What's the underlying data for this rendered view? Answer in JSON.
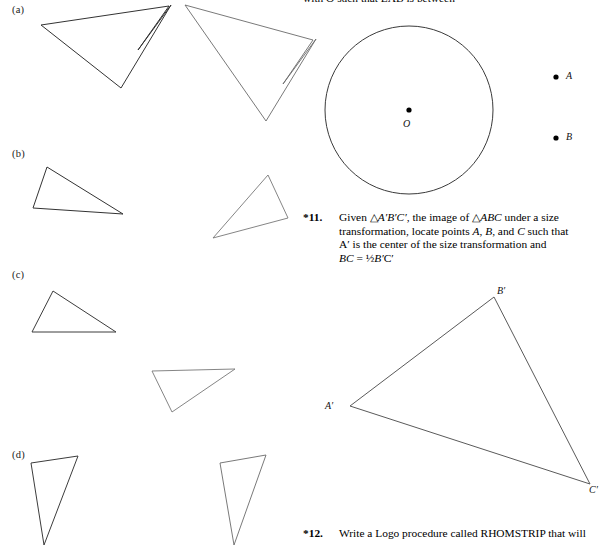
{
  "page": {
    "width": 611,
    "height": 545,
    "background": "#ffffff",
    "ink": "#1a1a1a"
  },
  "cut_off_line": {
    "text": "with O such that LAB is between",
    "note": "partially cropped text line at very top of page"
  },
  "part_labels": [
    {
      "id": "a",
      "text": "(a)",
      "x": 12,
      "y": 6
    },
    {
      "id": "b",
      "text": "(b)",
      "x": 12,
      "y": 150
    },
    {
      "id": "c",
      "text": "(c)",
      "x": 12,
      "y": 271
    },
    {
      "id": "d",
      "text": "(d)",
      "x": 12,
      "y": 450
    }
  ],
  "point_labels": [
    {
      "name": "O",
      "text": "O",
      "x": 403,
      "y": 118
    },
    {
      "name": "A",
      "text": "A",
      "x": 566,
      "y": 70
    },
    {
      "name": "B",
      "text": "B",
      "x": 566,
      "y": 131
    },
    {
      "name": "A-prime",
      "text": "A′",
      "x": 325,
      "y": 400
    },
    {
      "name": "B-prime",
      "text": "B′",
      "x": 497,
      "y": 285
    },
    {
      "name": "C-prime",
      "text": "C′",
      "x": 589,
      "y": 484
    }
  ],
  "problems": [
    {
      "id": "p11",
      "number": "*11.",
      "x": 303,
      "y": 211,
      "width": 300,
      "lines": [
        "Given △A′B′C′, the image of △ABC under a size",
        "transformation, locate points A, B, and C such that",
        "A′ is the center of the size transformation and",
        "BC = ½B′C′"
      ]
    },
    {
      "id": "p12",
      "number": "*12.",
      "x": 303,
      "y": 527,
      "width": 300,
      "lines": [
        "Write a Logo procedure called RHOMSTRIP that will"
      ]
    }
  ],
  "figures": {
    "circle": {
      "name": "circle-with-center-O",
      "cx": 409,
      "cy": 110,
      "r": 84,
      "stroke": "#333333",
      "stroke_width": 1
    },
    "dots": [
      {
        "name": "center-dot-O",
        "cx": 409,
        "cy": 110,
        "r": 2.6
      },
      {
        "name": "point-dot-A",
        "cx": 556,
        "cy": 77,
        "r": 2.6
      },
      {
        "name": "point-dot-B",
        "cx": 556,
        "cy": 138,
        "r": 2.6
      }
    ],
    "shapes": [
      {
        "name": "arrow-a-left",
        "points": "41,25 169,6 122,86 171,5 121,88 138,50",
        "stroke": "#333333"
      },
      {
        "name": "arrow-a-right",
        "points": "188,7 313,40 228,121",
        "stroke": "#555555"
      },
      {
        "name": "triangle-b-left",
        "points": "47,167 33,208 123,214",
        "stroke": "#333333"
      },
      {
        "name": "triangle-b-right",
        "points": "268,175 288,218 213,238",
        "stroke": "#666666"
      },
      {
        "name": "triangle-c-left",
        "points": "53,291 32,332 116,332",
        "stroke": "#444444"
      },
      {
        "name": "triangle-c-right",
        "points": "152,371 235,369 172,412",
        "stroke": "#666666"
      },
      {
        "name": "triangle-d-left",
        "points": "31,463 78,456 42,530",
        "stroke": "#444444"
      },
      {
        "name": "triangle-d-right",
        "points": "220,463 266,455 232,530",
        "stroke": "#555555"
      },
      {
        "name": "triangle-A-prime-B-prime-C-prime",
        "points": "350,406 494,297 590,484",
        "stroke": "#555555"
      }
    ]
  }
}
